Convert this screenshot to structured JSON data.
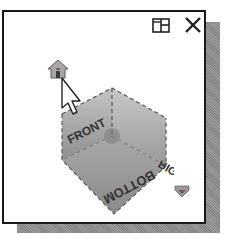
{
  "viewcube": {
    "faces": {
      "front": "FRONT",
      "right": "RIGHT",
      "bottom": "BOTTOM"
    },
    "controls": {
      "home": "home-icon",
      "window": "window-layout-icon",
      "close": "close-icon",
      "menu": "menu-chevron-icon"
    },
    "colors": {
      "cube_face_light": "#b8b8b8",
      "cube_face_dark": "#8a8a8a",
      "home_accent": "#9a6a6a",
      "border": "#1a1a1a",
      "shadow": "#8e8e8e"
    }
  }
}
